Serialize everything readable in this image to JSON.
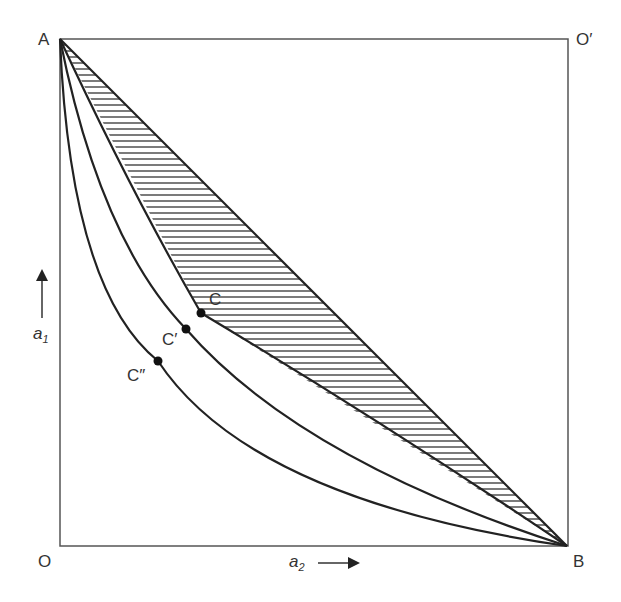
{
  "labels": {
    "A": "A",
    "O_prime": "O′",
    "O": "O",
    "B": "B",
    "C": "C",
    "C_prime": "C′",
    "C_dprime": "C″",
    "a1": "a",
    "a1_sub": "1",
    "a2": "a",
    "a2_sub": "2"
  },
  "points": {
    "A": [
      60,
      39
    ],
    "B": [
      567,
      546
    ],
    "C": [
      201,
      313
    ],
    "C_prime": [
      186,
      329
    ],
    "C_dprime": [
      158,
      361
    ]
  },
  "colors": {
    "line": "#222222",
    "box": "#555555"
  }
}
